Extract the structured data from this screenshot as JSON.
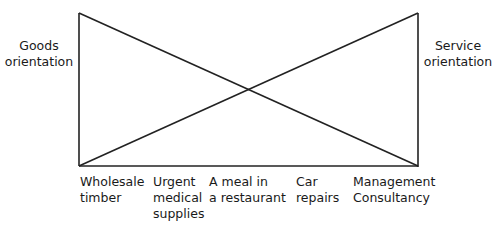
{
  "diagram": {
    "left_label": [
      "Goods",
      "orientation"
    ],
    "right_label": [
      "Service",
      "orientation"
    ],
    "categories": [
      {
        "lines": [
          "Wholesale",
          "timber"
        ],
        "x": 80
      },
      {
        "lines": [
          "Urgent",
          "medical",
          "supplies"
        ],
        "x": 153
      },
      {
        "lines": [
          "A meal in",
          "a restaurant"
        ],
        "x": 209
      },
      {
        "lines": [
          "Car",
          "repairs"
        ],
        "x": 296
      },
      {
        "lines": [
          "Management",
          "Consultancy"
        ],
        "x": 353
      }
    ],
    "geometry": {
      "left_x": 79,
      "right_x": 418,
      "top_y": 13,
      "bottom_y": 166,
      "stroke": "#222222"
    }
  },
  "caption": ""
}
